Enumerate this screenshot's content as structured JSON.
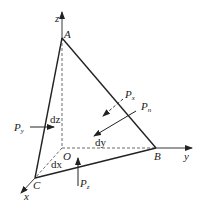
{
  "diagram": {
    "type": "tetrahedron-stress-element",
    "colors": {
      "line": "#222222",
      "background": "#ffffff"
    },
    "axes": {
      "x": "x",
      "y": "y",
      "z": "z"
    },
    "points": {
      "A": "A",
      "B": "B",
      "C": "C",
      "O": "O"
    },
    "dimensions": {
      "dx": "dx",
      "dy": "dy",
      "dz": "dz"
    },
    "forces": {
      "Px": {
        "base": "P",
        "sub": "x",
        "style": "dashed"
      },
      "Py": {
        "base": "P",
        "sub": "y",
        "style": "solid"
      },
      "Pz": {
        "base": "P",
        "sub": "z",
        "style": "solid"
      },
      "Pn": {
        "base": "P",
        "sub": "n",
        "style": "solid"
      }
    }
  }
}
